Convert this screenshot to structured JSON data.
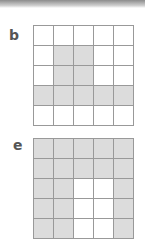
{
  "panels": [
    {
      "label": "b",
      "rows": [
        [
          0,
          0,
          0,
          0,
          0
        ],
        [
          0,
          1,
          1,
          0,
          0
        ],
        [
          0,
          1,
          1,
          0,
          0
        ],
        [
          1,
          1,
          1,
          1,
          1
        ],
        [
          0,
          0,
          0,
          0,
          0
        ]
      ]
    },
    {
      "label": "e",
      "rows": [
        [
          1,
          1,
          1,
          1,
          1
        ],
        [
          1,
          1,
          1,
          1,
          1
        ],
        [
          1,
          1,
          0,
          0,
          1
        ],
        [
          1,
          1,
          0,
          0,
          1
        ],
        [
          1,
          1,
          0,
          0,
          1
        ]
      ]
    }
  ],
  "colors": {
    "shaded": "#dcdcdc",
    "empty": "#ffffff",
    "line": "#999999"
  }
}
